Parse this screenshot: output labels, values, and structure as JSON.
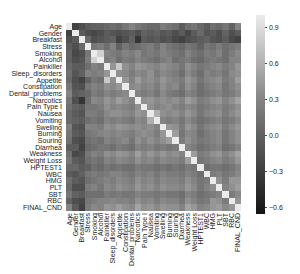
{
  "chart_data": {
    "type": "heatmap",
    "title": "",
    "xlabel": "",
    "ylabel": "",
    "colormap": "gray",
    "vmin": -0.65,
    "vmax": 1.0,
    "colorbar": {
      "ticks": [
        0.9,
        0.6,
        0.3,
        0.0,
        -0.3,
        -0.6
      ],
      "tick_labels": [
        "0.9",
        "0.6",
        "0.3",
        "0.0",
        "−0.3",
        "−0.6"
      ],
      "top_color": "#ebebeb",
      "bottom_color": "#141414"
    },
    "labels": [
      "Age",
      "Gender",
      "Breakfast",
      "Stress",
      "Smoking",
      "Alcohol",
      "Painkiller",
      "Sleep_disorders",
      "Appetite",
      "Constipation",
      "Dental_problems",
      "Narcotics",
      "Pain Type I",
      "Nausea",
      "Vomiting",
      "Swelling",
      "Burning",
      "Souring",
      "Diarrhea",
      "Weakness",
      "Weight Loss",
      "HPTEST1",
      "WBC",
      "HMG",
      "PLT",
      "SBT",
      "RBC",
      "FINAL_CND"
    ],
    "matrix": [
      [
        1.0,
        -0.3,
        -0.2,
        -0.1,
        -0.05,
        -0.05,
        0.0,
        0.05,
        0.0,
        0.1,
        0.2,
        0.1,
        0.05,
        0.0,
        0.0,
        0.15,
        0.1,
        0.05,
        -0.1,
        0.05,
        0.1,
        0.0,
        -0.1,
        0.05,
        0.0,
        0.1,
        -0.05,
        0.2
      ],
      [
        -0.3,
        1.0,
        -0.1,
        -0.2,
        -0.25,
        -0.2,
        -0.1,
        -0.15,
        -0.2,
        -0.15,
        -0.1,
        -0.2,
        -0.05,
        -0.1,
        -0.05,
        -0.15,
        -0.1,
        -0.2,
        -0.1,
        -0.25,
        -0.1,
        0.0,
        -0.15,
        -0.1,
        -0.2,
        -0.05,
        -0.2,
        -0.1
      ],
      [
        -0.2,
        -0.1,
        1.0,
        0.0,
        -0.2,
        -0.15,
        -0.1,
        -0.05,
        -0.3,
        -0.2,
        -0.05,
        -0.4,
        -0.1,
        -0.15,
        -0.1,
        -0.2,
        -0.15,
        -0.25,
        -0.3,
        -0.2,
        -0.15,
        -0.1,
        -0.05,
        -0.15,
        -0.2,
        -0.1,
        -0.25,
        -0.3
      ],
      [
        -0.1,
        -0.2,
        0.0,
        1.0,
        0.1,
        0.15,
        0.05,
        0.2,
        -0.05,
        0.1,
        0.0,
        0.05,
        0.1,
        0.15,
        0.05,
        0.2,
        0.1,
        0.05,
        0.0,
        0.1,
        0.05,
        -0.05,
        0.1,
        0.05,
        0.15,
        0.05,
        0.1,
        0.15
      ],
      [
        -0.05,
        -0.25,
        -0.2,
        0.1,
        1.0,
        0.8,
        0.2,
        0.15,
        0.1,
        0.2,
        0.15,
        0.25,
        0.1,
        0.15,
        0.1,
        0.2,
        0.15,
        0.1,
        0.05,
        0.2,
        0.1,
        0.05,
        0.15,
        0.1,
        0.2,
        0.05,
        0.15,
        0.25
      ],
      [
        -0.05,
        -0.2,
        -0.15,
        0.15,
        0.8,
        1.0,
        0.15,
        0.2,
        0.05,
        0.15,
        0.1,
        0.2,
        0.15,
        0.1,
        0.05,
        0.15,
        0.2,
        0.05,
        0.1,
        0.15,
        0.05,
        0.0,
        0.1,
        0.15,
        0.1,
        0.05,
        0.2,
        0.2
      ],
      [
        0.0,
        -0.1,
        -0.1,
        0.05,
        0.2,
        0.15,
        1.0,
        0.35,
        0.75,
        0.3,
        0.2,
        0.35,
        0.3,
        0.25,
        0.2,
        0.3,
        0.25,
        0.2,
        0.1,
        0.3,
        0.2,
        0.1,
        0.15,
        0.2,
        0.25,
        0.15,
        0.2,
        0.35
      ],
      [
        0.05,
        -0.15,
        -0.05,
        0.2,
        0.15,
        0.2,
        0.35,
        1.0,
        0.3,
        0.25,
        0.15,
        0.25,
        0.2,
        0.3,
        0.15,
        0.25,
        0.2,
        0.15,
        0.05,
        0.25,
        0.15,
        0.05,
        0.2,
        0.15,
        0.2,
        0.1,
        0.25,
        0.3
      ],
      [
        0.0,
        -0.2,
        -0.3,
        -0.05,
        0.1,
        0.05,
        0.75,
        0.3,
        1.0,
        0.35,
        0.2,
        0.4,
        0.25,
        0.3,
        0.2,
        0.35,
        0.25,
        0.2,
        0.15,
        0.35,
        0.25,
        0.1,
        0.2,
        0.25,
        0.3,
        0.15,
        0.2,
        0.4
      ],
      [
        0.1,
        -0.15,
        -0.2,
        0.1,
        0.2,
        0.15,
        0.3,
        0.25,
        0.35,
        1.0,
        0.25,
        0.3,
        0.2,
        0.25,
        0.15,
        0.3,
        0.2,
        0.25,
        0.1,
        0.3,
        0.2,
        0.05,
        0.15,
        0.2,
        0.25,
        0.1,
        0.2,
        0.3
      ],
      [
        0.2,
        -0.1,
        -0.05,
        0.0,
        0.15,
        0.1,
        0.2,
        0.15,
        0.2,
        0.25,
        1.0,
        0.2,
        0.15,
        0.2,
        0.1,
        0.25,
        0.15,
        0.1,
        0.05,
        0.2,
        0.15,
        0.05,
        0.1,
        0.15,
        0.2,
        0.1,
        0.15,
        0.25
      ],
      [
        0.1,
        -0.2,
        -0.4,
        0.05,
        0.25,
        0.2,
        0.35,
        0.25,
        0.4,
        0.3,
        0.2,
        1.0,
        0.3,
        0.35,
        0.25,
        0.3,
        0.25,
        0.3,
        0.2,
        0.4,
        0.3,
        0.15,
        0.2,
        0.3,
        0.35,
        0.2,
        0.3,
        0.45
      ],
      [
        0.05,
        -0.05,
        -0.1,
        0.1,
        0.1,
        0.15,
        0.3,
        0.2,
        0.25,
        0.2,
        0.15,
        0.3,
        1.0,
        0.3,
        0.2,
        0.25,
        0.3,
        0.2,
        0.15,
        0.25,
        0.2,
        0.1,
        0.15,
        0.2,
        0.25,
        0.15,
        0.2,
        0.3
      ],
      [
        0.0,
        -0.1,
        -0.15,
        0.15,
        0.15,
        0.1,
        0.25,
        0.3,
        0.3,
        0.25,
        0.2,
        0.35,
        0.3,
        1.0,
        0.55,
        0.3,
        0.25,
        0.3,
        0.2,
        0.35,
        0.25,
        0.1,
        0.2,
        0.25,
        0.3,
        0.15,
        0.25,
        0.35
      ],
      [
        0.0,
        -0.05,
        -0.1,
        0.05,
        0.1,
        0.05,
        0.2,
        0.15,
        0.2,
        0.15,
        0.1,
        0.25,
        0.2,
        0.55,
        1.0,
        0.2,
        0.15,
        0.2,
        0.1,
        0.25,
        0.15,
        0.05,
        0.1,
        0.15,
        0.2,
        0.1,
        0.15,
        0.25
      ],
      [
        0.15,
        -0.15,
        -0.2,
        0.2,
        0.2,
        0.15,
        0.3,
        0.25,
        0.35,
        0.3,
        0.25,
        0.3,
        0.25,
        0.3,
        0.2,
        1.0,
        0.35,
        0.3,
        0.15,
        0.35,
        0.25,
        0.1,
        0.2,
        0.25,
        0.3,
        0.15,
        0.25,
        0.35
      ],
      [
        0.1,
        -0.1,
        -0.15,
        0.1,
        0.15,
        0.2,
        0.25,
        0.2,
        0.25,
        0.2,
        0.15,
        0.25,
        0.3,
        0.25,
        0.15,
        0.35,
        1.0,
        0.4,
        0.1,
        0.25,
        0.2,
        0.05,
        0.15,
        0.2,
        0.25,
        0.1,
        0.2,
        0.3
      ],
      [
        0.05,
        -0.2,
        -0.25,
        0.05,
        0.1,
        0.05,
        0.2,
        0.15,
        0.2,
        0.25,
        0.1,
        0.3,
        0.2,
        0.3,
        0.2,
        0.3,
        0.4,
        1.0,
        0.15,
        0.3,
        0.2,
        0.1,
        0.15,
        0.2,
        0.25,
        0.1,
        0.2,
        0.3
      ],
      [
        -0.1,
        -0.1,
        -0.3,
        0.0,
        0.05,
        0.1,
        0.1,
        0.05,
        0.15,
        0.1,
        0.05,
        0.2,
        0.15,
        0.2,
        0.1,
        0.15,
        0.1,
        0.15,
        1.0,
        0.2,
        0.15,
        0.05,
        0.1,
        0.15,
        0.2,
        0.05,
        0.1,
        0.2
      ],
      [
        0.05,
        -0.25,
        -0.2,
        0.1,
        0.2,
        0.15,
        0.3,
        0.25,
        0.35,
        0.3,
        0.2,
        0.4,
        0.25,
        0.35,
        0.25,
        0.35,
        0.25,
        0.3,
        0.2,
        1.0,
        0.4,
        0.15,
        0.2,
        0.3,
        0.35,
        0.2,
        0.3,
        0.45
      ],
      [
        0.1,
        -0.1,
        -0.15,
        0.05,
        0.1,
        0.05,
        0.2,
        0.15,
        0.25,
        0.2,
        0.15,
        0.3,
        0.2,
        0.25,
        0.15,
        0.25,
        0.2,
        0.2,
        0.15,
        0.4,
        1.0,
        0.1,
        0.15,
        0.2,
        0.25,
        0.15,
        0.2,
        0.35
      ],
      [
        0.0,
        0.0,
        -0.1,
        -0.05,
        0.05,
        0.0,
        0.1,
        0.05,
        0.1,
        0.05,
        0.05,
        0.15,
        0.1,
        0.1,
        0.05,
        0.1,
        0.05,
        0.1,
        0.05,
        0.15,
        0.1,
        1.0,
        0.05,
        0.1,
        0.1,
        0.05,
        0.1,
        0.2
      ],
      [
        -0.1,
        -0.15,
        -0.05,
        0.1,
        0.15,
        0.1,
        0.15,
        0.2,
        0.2,
        0.15,
        0.1,
        0.2,
        0.15,
        0.2,
        0.1,
        0.2,
        0.15,
        0.15,
        0.1,
        0.2,
        0.15,
        0.05,
        1.0,
        0.15,
        0.2,
        0.1,
        0.15,
        0.25
      ],
      [
        0.05,
        -0.1,
        -0.15,
        0.05,
        0.1,
        0.15,
        0.2,
        0.15,
        0.25,
        0.2,
        0.15,
        0.3,
        0.2,
        0.25,
        0.15,
        0.25,
        0.2,
        0.2,
        0.15,
        0.3,
        0.2,
        0.1,
        0.15,
        1.0,
        0.3,
        0.15,
        0.35,
        0.35
      ],
      [
        0.0,
        -0.2,
        -0.2,
        0.15,
        0.2,
        0.1,
        0.25,
        0.2,
        0.3,
        0.25,
        0.2,
        0.35,
        0.25,
        0.3,
        0.2,
        0.3,
        0.25,
        0.25,
        0.2,
        0.35,
        0.25,
        0.1,
        0.2,
        0.3,
        1.0,
        0.2,
        0.3,
        0.4
      ],
      [
        0.1,
        -0.05,
        -0.1,
        0.05,
        0.05,
        0.05,
        0.15,
        0.1,
        0.15,
        0.1,
        0.1,
        0.2,
        0.15,
        0.15,
        0.1,
        0.15,
        0.1,
        0.1,
        0.05,
        0.2,
        0.15,
        0.05,
        0.1,
        0.15,
        0.2,
        1.0,
        0.15,
        0.25
      ],
      [
        -0.05,
        -0.2,
        -0.25,
        0.1,
        0.15,
        0.2,
        0.2,
        0.25,
        0.2,
        0.2,
        0.15,
        0.3,
        0.2,
        0.25,
        0.15,
        0.25,
        0.2,
        0.2,
        0.1,
        0.3,
        0.2,
        0.1,
        0.15,
        0.35,
        0.3,
        0.15,
        1.0,
        0.35
      ],
      [
        0.2,
        -0.1,
        -0.3,
        0.15,
        0.25,
        0.2,
        0.35,
        0.3,
        0.4,
        0.3,
        0.25,
        0.45,
        0.3,
        0.35,
        0.25,
        0.35,
        0.3,
        0.3,
        0.2,
        0.45,
        0.35,
        0.2,
        0.25,
        0.35,
        0.4,
        0.25,
        0.35,
        1.0
      ]
    ],
    "grid": false,
    "legend": "colorbar-right"
  }
}
